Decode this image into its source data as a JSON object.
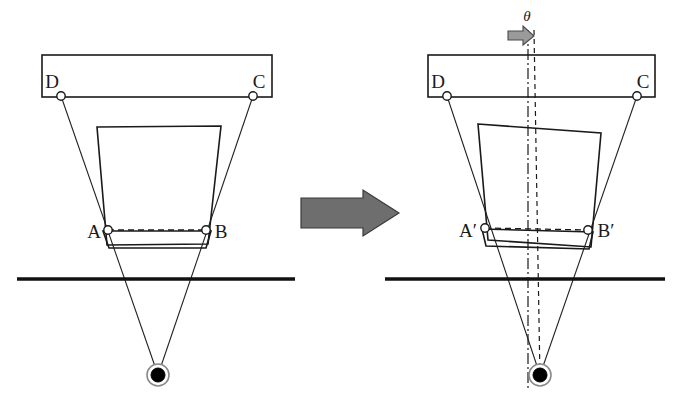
{
  "figure": {
    "colors": {
      "line": "#1a1a1a",
      "ground": "#111111",
      "arrow_fill": "#6e6e6e",
      "arrow_stroke": "#3a3a3a",
      "rotation_arrow_fill": "#9a9a9a",
      "target_center": "#000000",
      "joint_fill": "#ffffff",
      "background": "#ffffff"
    }
  },
  "left_panel": {
    "name": "initial-state",
    "labels": {
      "d": "D",
      "c": "C",
      "a": "A",
      "b": "B"
    },
    "bar": {
      "x": 42,
      "y": 55,
      "width": 230,
      "height": 42
    },
    "joints": {
      "d": {
        "x": 61,
        "y": 96
      },
      "c": {
        "x": 253,
        "y": 96
      },
      "a": {
        "x": 108,
        "y": 230
      },
      "b": {
        "x": 206,
        "y": 230
      }
    },
    "body_polygon": "97,127 221,126 208,244 107,245",
    "lower_flap": "103,231 211,231 206,248 109,248",
    "ab_dashed": {
      "x1": 108,
      "y1": 230,
      "x2": 206,
      "y2": 230
    },
    "ground_line": {
      "x1": 17,
      "y1": 279,
      "x2": 295,
      "y2": 279
    },
    "target": {
      "x": 158,
      "y": 375,
      "outer_r": 11,
      "inner_r": 7
    },
    "links": [
      {
        "name": "link-d-to-target",
        "x1": 61,
        "y1": 96,
        "x2": 158,
        "y2": 375
      },
      {
        "name": "link-c-to-target",
        "x1": 253,
        "y1": 96,
        "x2": 158,
        "y2": 375
      }
    ]
  },
  "right_panel": {
    "name": "rotated-state",
    "labels": {
      "d": "D",
      "c": "C",
      "a": "A′",
      "b": "B′",
      "theta": "θ"
    },
    "bar": {
      "x": 428,
      "y": 55,
      "width": 227,
      "height": 42
    },
    "joints": {
      "d": {
        "x": 447,
        "y": 96
      },
      "c": {
        "x": 637,
        "y": 96
      },
      "a": {
        "x": 485,
        "y": 228
      },
      "b": {
        "x": 588,
        "y": 230
      }
    },
    "body_polygon": "478,124 601,133 591,247 488,240",
    "lower_flap": "482,229 593,232 589,249 486,246",
    "ab_dashed": {
      "x1": 485,
      "y1": 228,
      "x2": 588,
      "y2": 230
    },
    "ground_line": {
      "x1": 385,
      "y1": 279,
      "x2": 665,
      "y2": 279
    },
    "target": {
      "x": 540,
      "y": 375,
      "outer_r": 11,
      "inner_r": 7
    },
    "axis_vertical_dashdot": {
      "x1": 528,
      "y1": 30,
      "x2": 528,
      "y2": 390
    },
    "axis_tilted_dashed": {
      "x1": 534,
      "y1": 30,
      "x2": 540,
      "y2": 378
    },
    "theta_label_pos": {
      "x": 528,
      "y": 22
    },
    "rotation_arrow": {
      "x": 508,
      "y": 28,
      "width": 26,
      "height": 18
    },
    "links": [
      {
        "name": "link-d-to-target",
        "x1": 447,
        "y1": 96,
        "x2": 540,
        "y2": 375
      },
      {
        "name": "link-c-to-target",
        "x1": 637,
        "y1": 96,
        "x2": 540,
        "y2": 375
      }
    ]
  },
  "transition_arrow": {
    "name": "transition-arrow",
    "direction": "right",
    "polygon": "301,198 363,198 363,190 399,213 363,236 363,228 301,228"
  }
}
